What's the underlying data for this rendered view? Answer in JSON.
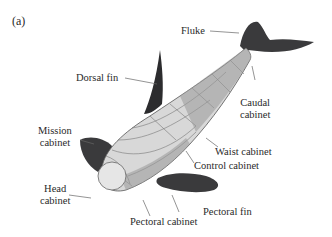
{
  "figure": {
    "panel_label": "(a)",
    "labels": {
      "fluke": "Fluke",
      "dorsal_fin": "Dorsal fin",
      "caudal_cabinet_1": "Caudal",
      "caudal_cabinet_2": "cabinet",
      "mission_cabinet_1": "Mission",
      "mission_cabinet_2": "cabinet",
      "waist_cabinet": "Waist cabinet",
      "control_cabinet": "Control cabinet",
      "head_cabinet_1": "Head",
      "head_cabinet_2": "cabinet",
      "pectoral_fin": "Pectoral fin",
      "pectoral_cabinet": "Pectoral cabinet"
    },
    "colors": {
      "fin": "#3a3a3c",
      "body_outline": "#555555",
      "leader_line": "#666666"
    }
  }
}
